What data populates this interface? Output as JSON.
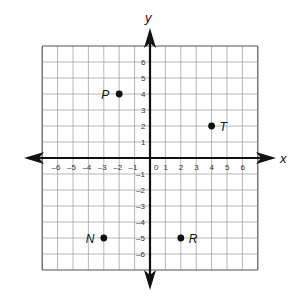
{
  "chart_data": {
    "type": "scatter",
    "title": "",
    "xlabel": "x",
    "ylabel": "y",
    "xlim": [
      -7,
      7
    ],
    "ylim": [
      -7,
      7
    ],
    "grid": true,
    "x_ticks": [
      "-6",
      "-5",
      "-4",
      "-3",
      "-2",
      "-1",
      "0",
      "1",
      "2",
      "3",
      "4",
      "5",
      "6"
    ],
    "y_ticks": [
      "-6",
      "-5",
      "-4",
      "-3",
      "-2",
      "-1",
      "1",
      "2",
      "3",
      "4",
      "5",
      "6"
    ],
    "points": [
      {
        "label": "P",
        "x": -2,
        "y": 4,
        "label_side": "left"
      },
      {
        "label": "T",
        "x": 4,
        "y": 2,
        "label_side": "right"
      },
      {
        "label": "N",
        "x": -3,
        "y": -5,
        "label_side": "left"
      },
      {
        "label": "R",
        "x": 2,
        "y": -5,
        "label_side": "right"
      }
    ]
  },
  "colors": {
    "grid": "#9a9a9a",
    "axis": "#111111",
    "point": "#111111"
  }
}
